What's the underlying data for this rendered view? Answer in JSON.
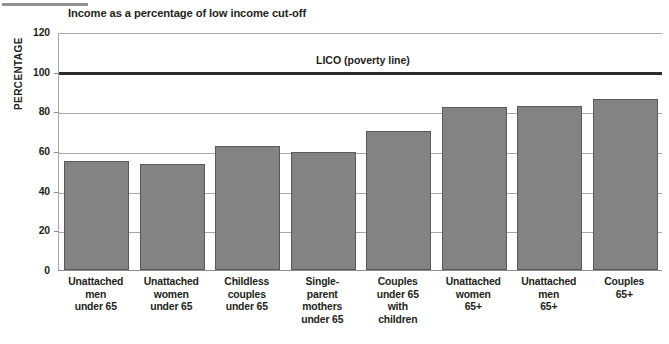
{
  "page": {
    "top_rule_icon": "horizontal-rule-decoration"
  },
  "chart_data": {
    "type": "bar",
    "title": "Income as a percentage of low income cut-off",
    "xlabel": "",
    "ylabel": "PERCENTAGE",
    "ylim": [
      0,
      120
    ],
    "yticks": [
      0,
      20,
      40,
      60,
      80,
      100,
      120
    ],
    "ytick_labels": [
      "0",
      "20",
      "40",
      "60",
      "80",
      "100",
      "120"
    ],
    "grid": true,
    "legend_position": "none",
    "bar_color": "#828385",
    "bar_border_color": "#58595b",
    "reference_line": {
      "label": "LICO (poverty line)",
      "value": 100,
      "color": "#2b2b2b"
    },
    "categories": [
      "Unattached men under 65",
      "Unattached women under 65",
      "Childless couples under 65",
      "Single-parent mothers under 65",
      "Couples under 65 with children",
      "Unattached women 65+",
      "Unattached men 65+",
      "Couples 65+"
    ],
    "category_lines": [
      [
        "Unattached",
        "men",
        "under 65"
      ],
      [
        "Unattached",
        "women",
        "under 65"
      ],
      [
        "Childless",
        "couples",
        "under 65"
      ],
      [
        "Single-",
        "parent",
        "mothers",
        "under 65"
      ],
      [
        "Couples",
        "under 65",
        "with",
        "children"
      ],
      [
        "Unattached",
        "women",
        "65+"
      ],
      [
        "Unattached",
        "men",
        "65+"
      ],
      [
        "Couples",
        "65+"
      ]
    ],
    "values": [
      55,
      53.5,
      62.5,
      59.5,
      70,
      82,
      82.5,
      86
    ]
  }
}
